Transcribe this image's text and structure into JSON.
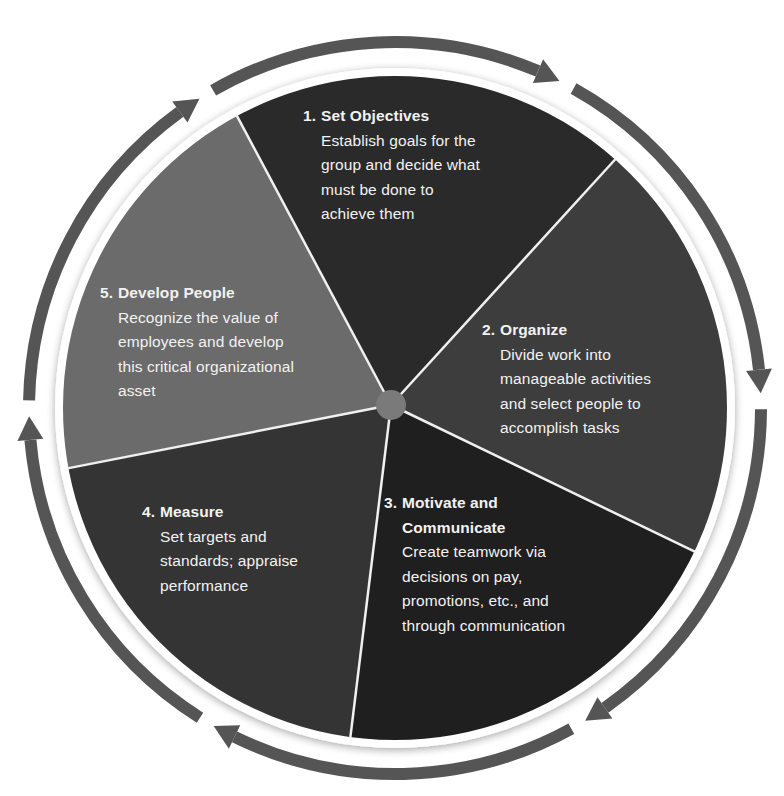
{
  "diagram": {
    "type": "cycle-pie",
    "colors": {
      "slice_1": "#2a2a2a",
      "slice_2": "#3d3d3d",
      "slice_3": "#1f1f1f",
      "slice_4": "#343434",
      "slice_5": "#6b6b6b",
      "hub": "#7a7a7a",
      "arrow": "#555555",
      "divider": "#f0f0f0",
      "text": "#f2f2f2"
    },
    "steps": [
      {
        "number": "1.",
        "title": "Set Objectives",
        "title_lines": [
          "Set Objectives"
        ],
        "lines": [
          "Establish goals for the",
          "group and decide what",
          "must be done to",
          "achieve them"
        ]
      },
      {
        "number": "2.",
        "title": "Organize",
        "title_lines": [
          "Organize"
        ],
        "lines": [
          "Divide work into",
          "manageable activities",
          "and select people to",
          "accomplish tasks"
        ]
      },
      {
        "number": "3.",
        "title": "Motivate and Communicate",
        "title_lines": [
          "Motivate and",
          "Communicate"
        ],
        "lines": [
          "Create teamwork via",
          "decisions on pay,",
          "promotions, etc., and",
          "through communication"
        ]
      },
      {
        "number": "4.",
        "title": "Measure",
        "title_lines": [
          "Measure"
        ],
        "lines": [
          "Set targets and",
          "standards; appraise",
          "performance"
        ]
      },
      {
        "number": "5.",
        "title": "Develop People",
        "title_lines": [
          "Develop People"
        ],
        "lines": [
          "Recognize the value of",
          "employees and develop",
          "this critical organizational",
          "asset"
        ]
      }
    ],
    "cycle_direction": "clockwise",
    "arrow_count": 6
  }
}
